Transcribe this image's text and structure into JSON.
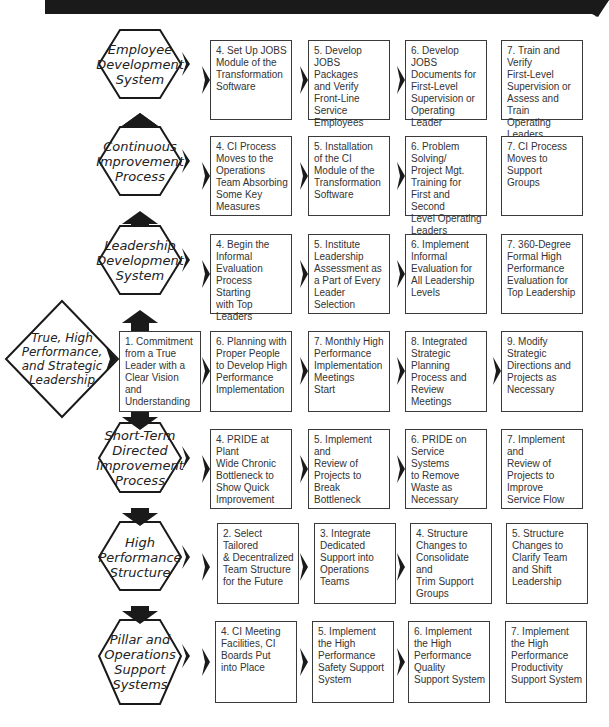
{
  "diagram": {
    "top_arrow": {
      "direction": "right",
      "color": "#1a1a1a"
    },
    "start_node": {
      "shape": "diamond",
      "label": "True, High\nPerformance,\nand Strategic\nLeadership"
    },
    "rows": [
      {
        "pillar": "Employee\nDevelopment\nSystem",
        "steps": [
          "4. Set Up JOBS\n   Module of the\n   Transformation\n   Software",
          "5. Develop\n   JOBS Packages\n   and Verify\n   Front-Line\n   Service\n   Employees",
          "6. Develop JOBS\n   Documents for\n   First-Level\n   Supervision or\n   Operating\n   Leader",
          "7. Train and Verify\n   First-Level\n   Supervision or\n   Assess and Train\n   Operating\n   Leaders"
        ]
      },
      {
        "pillar": "Continuous\nImprovement\nProcess",
        "steps": [
          "4. CI Process\n   Moves to the\n   Operations\n   Team Absorbing\n   Some Key\n   Measures",
          "5. Installation\n   of the CI\n   Module of the\n   Transformation\n   Software",
          "6. Problem Solving/\n   Project Mgt.\n   Training for\n   First and Second\n   Level Operating\n   Leaders",
          "7. CI Process\n   Moves to\n   Support\n   Groups"
        ]
      },
      {
        "pillar": "Leadership\nDevelopment\nSystem",
        "steps": [
          "4. Begin the\n   Informal\n   Evaluation\n   Process Starting\n   with Top\n   Leaders",
          "5. Institute\n   Leadership\n   Assessment as\n   a Part of Every\n   Leader Selection",
          "6. Implement\n   Informal\n   Evaluation for\n   All Leadership\n   Levels",
          "7. 360-Degree\n   Formal High\n   Performance\n   Evaluation for\n   Top Leadership"
        ]
      },
      {
        "pillar": null,
        "steps": [
          "1. Commitment\n   from a True\n   Leader with a\n   Clear Vision and\n   Understanding",
          "6. Planning with\n   Proper People\n   to Develop High\n   Performance\n   Implementation",
          "7. Monthly High\n   Performance\n   Implementation\n   Meetings\n   Start",
          "8. Integrated\n   Strategic\n   Planning\n   Process and\n   Review\n   Meetings",
          "9. Modify\n   Strategic\n   Directions and\n   Projects as\n   Necessary"
        ]
      },
      {
        "pillar": "Short-Term\nDirected\nImprovement\nProcess",
        "steps": [
          "4. PRIDE at Plant\n   Wide Chronic\n   Bottleneck to\n   Show Quick\n   Improvement",
          "5. Implement and\n   Review of\n   Projects to\n   Break\n   Bottleneck",
          "6. PRIDE on\n   Service Systems\n   to Remove\n   Waste as\n   Necessary",
          "7. Implement and\n   Review of\n   Projects to\n   Improve\n   Service Flow"
        ]
      },
      {
        "pillar": "High\nPerformance\nStructure",
        "steps": [
          "2. Select Tailored\n   & Decentralized\n   Team Structure\n   for the Future",
          "3. Integrate\n   Dedicated\n   Support into\n   Operations\n   Teams",
          "4. Structure\n   Changes to\n   Consolidate and\n   Trim Support\n   Groups",
          "5. Structure\n   Changes to\n   Clarify Team\n   and Shift\n   Leadership"
        ]
      },
      {
        "pillar": "Pillar and\nOperations\nSupport\nSystems",
        "steps": [
          "4. CI Meeting\n   Facilities, CI\n   Boards Put\n   into Place",
          "5. Implement\n   the High\n   Performance\n   Safety Support\n   System",
          "6. Implement\n   the High\n   Performance\n   Quality\n   Support System",
          "7. Implement\n   the High\n   Performance\n   Productivity\n   Support System"
        ]
      }
    ]
  }
}
